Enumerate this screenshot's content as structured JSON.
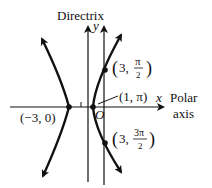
{
  "diagram": {
    "directrix_label": "Directrix",
    "y_label": "y",
    "x_label": "x",
    "polar_label_line1": "Polar",
    "polar_label_line2": "axis",
    "origin_label": "O",
    "tick_label": "1",
    "points": [
      {
        "name": "left-vertex",
        "label": "(−3, 0)"
      },
      {
        "name": "right-vertex",
        "label": "(1, π)"
      },
      {
        "name": "upper-point",
        "label_prefix": "3,",
        "frac_num": "π",
        "frac_den": "2"
      },
      {
        "name": "lower-point",
        "label_prefix": "3,",
        "frac_num": "3π",
        "frac_den": "2"
      }
    ],
    "colors": {
      "ink": "#111111",
      "background": "#ffffff"
    }
  }
}
